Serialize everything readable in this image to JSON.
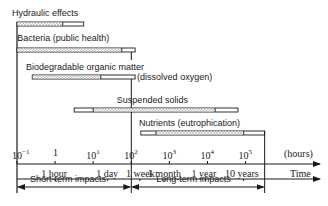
{
  "chart_data": {
    "type": "timeline",
    "title": "",
    "xlabel": "Time",
    "x_units": "(hours)",
    "x_scale": "log10",
    "xlim_hours": [
      0.1,
      300000
    ],
    "x_ticks": [
      {
        "label": "10^-1",
        "exp": -1,
        "base": "10",
        "sup": "−1"
      },
      {
        "label": "1",
        "exp": 0,
        "base": "1",
        "sup": ""
      },
      {
        "label": "10^1",
        "exp": 1,
        "base": "10",
        "sup": "1"
      },
      {
        "label": "10^2",
        "exp": 2,
        "base": "10",
        "sup": "2"
      },
      {
        "label": "10^3",
        "exp": 3,
        "base": "10",
        "sup": "3"
      },
      {
        "label": "10^4",
        "exp": 4,
        "base": "10",
        "sup": "4"
      },
      {
        "label": "10^5",
        "exp": 5,
        "base": "10",
        "sup": "5"
      }
    ],
    "time_ticks": [
      {
        "label": "1 hour",
        "hours": 1
      },
      {
        "label": "1 day",
        "hours": 24
      },
      {
        "label": "1 week",
        "hours": 168
      },
      {
        "label": "1 month",
        "hours": 720
      },
      {
        "label": "1 year",
        "hours": 8760
      },
      {
        "label": "10 years",
        "hours": 87600
      }
    ],
    "series": [
      {
        "name": "Hydraulic effects",
        "note": "",
        "start_exp": -1.0,
        "hatch_start_exp": -1.0,
        "hatch_end_exp": 0.2,
        "end_exp": 0.75
      },
      {
        "name": "Bacteria (public health)",
        "note": "",
        "start_exp": -1.0,
        "hatch_start_exp": -1.0,
        "hatch_end_exp": 1.75,
        "end_exp": 2.1
      },
      {
        "name": "Biodegradable organic matter",
        "note": "(dissolved oxygen)",
        "start_exp": -0.6,
        "hatch_start_exp": -0.6,
        "hatch_end_exp": 1.2,
        "end_exp": 2.1
      },
      {
        "name": "Suspended solids",
        "note": "",
        "start_exp": 0.5,
        "hatch_start_exp": 1.0,
        "hatch_end_exp": 4.2,
        "end_exp": 4.8
      },
      {
        "name": "Nutrients (eutrophication)",
        "note": "",
        "start_exp": 2.25,
        "hatch_start_exp": 2.65,
        "hatch_end_exp": 4.95,
        "end_exp": 5.5
      }
    ],
    "impact_ranges": [
      {
        "label": "Short-term impacts",
        "from_exp": -1,
        "to_exp": 2
      },
      {
        "label": "Long-term impacts",
        "from_exp": 2,
        "to_exp": 5.5
      }
    ],
    "grid": false,
    "legend": "none"
  },
  "axis": {
    "units_label": "(hours)",
    "time_label": "Time"
  },
  "impacts": {
    "short": "Short-term impacts",
    "long": "Long-term impacts"
  },
  "colors": {
    "ink": "#1a1a1a",
    "hatch": "#8a8a8a",
    "background": "#ffffff"
  }
}
